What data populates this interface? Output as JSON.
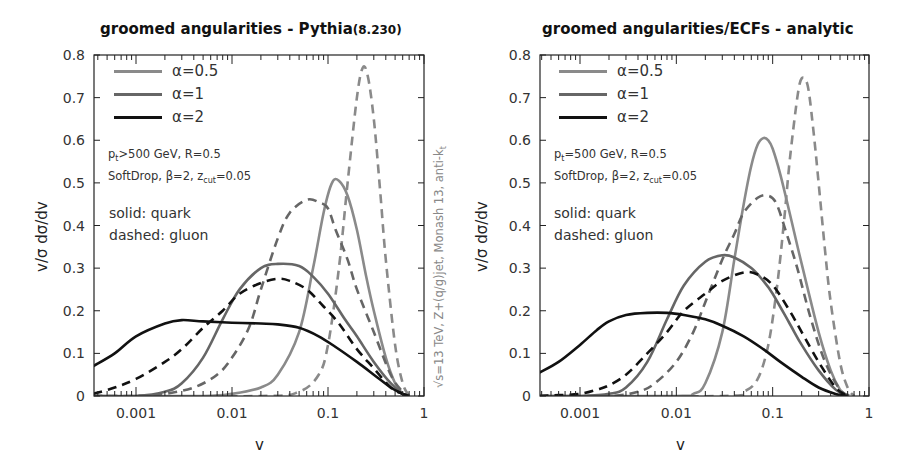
{
  "chart_data": [
    {
      "type": "line",
      "title": "groomed angularities - Pythia",
      "title_suffix": "(8.230)",
      "xlabel": "v",
      "ylabel": "v/σ dσ/dv",
      "xscale": "log",
      "xlim": [
        0.00036,
        1
      ],
      "ylim": [
        0,
        0.8
      ],
      "xticks": [
        "0.001",
        "0.01",
        "0.1",
        "1"
      ],
      "yticks": [
        "0",
        "0.1",
        "0.2",
        "0.3",
        "0.4",
        "0.5",
        "0.6",
        "0.7",
        "0.8"
      ],
      "legend": [
        "α=0.5",
        "α=1",
        "α=2"
      ],
      "annotations": [
        "p_t>500 GeV, R=0.5",
        "SoftDrop, β=2, z_cut=0.05",
        "solid: quark",
        "dashed: gluon"
      ],
      "side_note": "√s=13 TeV, Z+(q/g)jet, Monash 13, anti-k_t",
      "series": [
        {
          "name": "α=0.5 quark",
          "style": "solid",
          "color": "#8a8a8a",
          "x": [
            0.00036,
            0.005,
            0.01,
            0.02,
            0.03,
            0.05,
            0.07,
            0.09,
            0.11,
            0.13,
            0.16,
            0.2,
            0.25,
            0.3,
            0.4,
            0.5,
            0.6,
            0.7
          ],
          "y": [
            0,
            0,
            0.005,
            0.02,
            0.05,
            0.15,
            0.3,
            0.43,
            0.5,
            0.505,
            0.47,
            0.39,
            0.28,
            0.2,
            0.09,
            0.03,
            0.005,
            0
          ]
        },
        {
          "name": "α=0.5 gluon",
          "style": "dashed",
          "color": "#8a8a8a",
          "x": [
            0.00036,
            0.02,
            0.05,
            0.08,
            0.1,
            0.13,
            0.16,
            0.2,
            0.23,
            0.26,
            0.3,
            0.35,
            0.4,
            0.5,
            0.6,
            0.7
          ],
          "y": [
            0,
            0,
            0.01,
            0.05,
            0.12,
            0.3,
            0.5,
            0.7,
            0.77,
            0.75,
            0.65,
            0.48,
            0.32,
            0.12,
            0.03,
            0
          ]
        },
        {
          "name": "α=1 quark",
          "style": "solid",
          "color": "#666666",
          "x": [
            0.00036,
            0.001,
            0.002,
            0.003,
            0.005,
            0.008,
            0.012,
            0.02,
            0.03,
            0.05,
            0.07,
            0.1,
            0.15,
            0.2,
            0.3,
            0.45,
            0.6,
            0.7
          ],
          "y": [
            0,
            0,
            0.01,
            0.03,
            0.09,
            0.18,
            0.25,
            0.3,
            0.31,
            0.305,
            0.28,
            0.24,
            0.18,
            0.14,
            0.08,
            0.03,
            0.005,
            0
          ]
        },
        {
          "name": "α=1 gluon",
          "style": "dashed",
          "color": "#666666",
          "x": [
            0.00036,
            0.001,
            0.002,
            0.004,
            0.007,
            0.01,
            0.015,
            0.02,
            0.03,
            0.04,
            0.06,
            0.08,
            0.1,
            0.12,
            0.16,
            0.2,
            0.3,
            0.45,
            0.6,
            0.7
          ],
          "y": [
            0,
            0,
            0.005,
            0.02,
            0.05,
            0.09,
            0.16,
            0.25,
            0.37,
            0.43,
            0.46,
            0.455,
            0.44,
            0.39,
            0.32,
            0.25,
            0.15,
            0.05,
            0.01,
            0
          ]
        },
        {
          "name": "α=2 quark",
          "style": "solid",
          "color": "#111111",
          "x": [
            0.00036,
            0.0006,
            0.001,
            0.002,
            0.003,
            0.005,
            0.01,
            0.02,
            0.03,
            0.05,
            0.08,
            0.12,
            0.2,
            0.3,
            0.45,
            0.6,
            0.7
          ],
          "y": [
            0.07,
            0.1,
            0.14,
            0.17,
            0.178,
            0.175,
            0.172,
            0.17,
            0.168,
            0.16,
            0.14,
            0.115,
            0.08,
            0.05,
            0.02,
            0.005,
            0
          ]
        },
        {
          "name": "α=2 gluon",
          "style": "dashed",
          "color": "#111111",
          "x": [
            0.00036,
            0.0006,
            0.001,
            0.002,
            0.003,
            0.005,
            0.008,
            0.012,
            0.02,
            0.03,
            0.04,
            0.06,
            0.09,
            0.13,
            0.2,
            0.3,
            0.45,
            0.6,
            0.7
          ],
          "y": [
            0.005,
            0.02,
            0.04,
            0.08,
            0.11,
            0.16,
            0.2,
            0.24,
            0.265,
            0.275,
            0.27,
            0.25,
            0.21,
            0.17,
            0.11,
            0.065,
            0.02,
            0.005,
            0
          ]
        }
      ]
    },
    {
      "type": "line",
      "title": "groomed angularities/ECFs - analytic",
      "xlabel": "v",
      "ylabel": "v/σ dσ/dv",
      "xscale": "log",
      "xlim": [
        0.00038,
        1
      ],
      "ylim": [
        0,
        0.8
      ],
      "xticks": [
        "0.001",
        "0.01",
        "0.1",
        "1"
      ],
      "yticks": [
        "0",
        "0.1",
        "0.2",
        "0.3",
        "0.4",
        "0.5",
        "0.6",
        "0.7",
        "0.8"
      ],
      "legend": [
        "α=0.5",
        "α=1",
        "α=2"
      ],
      "annotations": [
        "p_t=500 GeV, R=0.5",
        "SoftDrop, β=2, z_cut=0.05",
        "solid: quark",
        "dashed: gluon"
      ],
      "series": [
        {
          "name": "α=0.5 quark",
          "style": "solid",
          "color": "#8a8a8a",
          "x": [
            0.00038,
            0.01,
            0.015,
            0.02,
            0.03,
            0.04,
            0.05,
            0.06,
            0.07,
            0.08,
            0.09,
            0.1,
            0.12,
            0.15,
            0.2,
            0.3,
            0.4,
            0.5,
            0.6
          ],
          "y": [
            0,
            0,
            0.005,
            0.03,
            0.15,
            0.32,
            0.45,
            0.54,
            0.59,
            0.605,
            0.6,
            0.58,
            0.52,
            0.43,
            0.31,
            0.15,
            0.06,
            0.015,
            0
          ]
        },
        {
          "name": "α=0.5 gluon",
          "style": "dashed",
          "color": "#8a8a8a",
          "x": [
            0.00038,
            0.03,
            0.05,
            0.07,
            0.09,
            0.11,
            0.13,
            0.15,
            0.18,
            0.2,
            0.23,
            0.26,
            0.3,
            0.35,
            0.4,
            0.5,
            0.6,
            0.7
          ],
          "y": [
            0,
            0,
            0.01,
            0.04,
            0.12,
            0.25,
            0.4,
            0.55,
            0.7,
            0.745,
            0.73,
            0.64,
            0.5,
            0.34,
            0.22,
            0.08,
            0.02,
            0
          ]
        },
        {
          "name": "α=1 quark",
          "style": "solid",
          "color": "#666666",
          "x": [
            0.00038,
            0.001,
            0.002,
            0.003,
            0.005,
            0.008,
            0.012,
            0.02,
            0.03,
            0.04,
            0.06,
            0.08,
            0.1,
            0.15,
            0.2,
            0.3,
            0.45,
            0.6
          ],
          "y": [
            0,
            0,
            0.005,
            0.02,
            0.08,
            0.18,
            0.26,
            0.315,
            0.33,
            0.325,
            0.3,
            0.27,
            0.24,
            0.17,
            0.12,
            0.06,
            0.015,
            0
          ]
        },
        {
          "name": "α=1 gluon",
          "style": "dashed",
          "color": "#666666",
          "x": [
            0.00038,
            0.002,
            0.004,
            0.006,
            0.01,
            0.015,
            0.02,
            0.03,
            0.04,
            0.05,
            0.07,
            0.09,
            0.11,
            0.14,
            0.18,
            0.25,
            0.35,
            0.5,
            0.65
          ],
          "y": [
            0,
            0,
            0.01,
            0.03,
            0.08,
            0.15,
            0.22,
            0.32,
            0.38,
            0.43,
            0.465,
            0.47,
            0.45,
            0.38,
            0.3,
            0.18,
            0.08,
            0.015,
            0
          ]
        },
        {
          "name": "α=2 quark",
          "style": "solid",
          "color": "#111111",
          "x": [
            0.00038,
            0.0006,
            0.001,
            0.0015,
            0.002,
            0.003,
            0.005,
            0.008,
            0.012,
            0.02,
            0.03,
            0.05,
            0.08,
            0.12,
            0.2,
            0.3,
            0.45,
            0.6
          ],
          "y": [
            0.055,
            0.08,
            0.12,
            0.155,
            0.175,
            0.19,
            0.195,
            0.195,
            0.19,
            0.18,
            0.165,
            0.14,
            0.11,
            0.08,
            0.045,
            0.02,
            0.005,
            0
          ]
        },
        {
          "name": "α=2 gluon",
          "style": "dashed",
          "color": "#111111",
          "x": [
            0.00038,
            0.0006,
            0.001,
            0.0015,
            0.002,
            0.003,
            0.005,
            0.008,
            0.012,
            0.02,
            0.03,
            0.05,
            0.07,
            0.1,
            0.15,
            0.2,
            0.3,
            0.45,
            0.6
          ],
          "y": [
            0,
            0.002,
            0.005,
            0.015,
            0.025,
            0.05,
            0.1,
            0.15,
            0.2,
            0.24,
            0.27,
            0.29,
            0.285,
            0.26,
            0.2,
            0.15,
            0.08,
            0.02,
            0
          ]
        }
      ]
    }
  ],
  "panels": [
    {
      "title": "groomed angularities - Pythia",
      "title_suffix": "(8.230)",
      "xlabel": "v",
      "ylabel": "v/σ dσ/dv",
      "legend": [
        {
          "label": "α=0.5",
          "color": "#8a8a8a"
        },
        {
          "label": "α=1",
          "color": "#666666"
        },
        {
          "label": "α=2",
          "color": "#111111"
        }
      ],
      "annot_pt_main": "p",
      "annot_pt_sub": "t",
      "annot_pt_rest": ">500 GeV, R=0.5",
      "annot_sd_main": "SoftDrop, β=2, z",
      "annot_sd_sub": "cut",
      "annot_sd_rest": "=0.05",
      "annot_solid": "solid: quark",
      "annot_dashed": "dashed: gluon",
      "side_note_main": "√s=13 TeV, Z+(q/g)jet, Monash 13, anti-k",
      "side_note_sub": "t"
    },
    {
      "title": "groomed angularities/ECFs - analytic",
      "xlabel": "v",
      "ylabel": "v/σ dσ/dv",
      "legend": [
        {
          "label": "α=0.5",
          "color": "#8a8a8a"
        },
        {
          "label": "α=1",
          "color": "#666666"
        },
        {
          "label": "α=2",
          "color": "#111111"
        }
      ],
      "annot_pt_main": "p",
      "annot_pt_sub": "t",
      "annot_pt_rest": "=500 GeV, R=0.5",
      "annot_sd_main": "SoftDrop, β=2, z",
      "annot_sd_sub": "cut",
      "annot_sd_rest": "=0.05",
      "annot_solid": "solid: quark",
      "annot_dashed": "dashed: gluon"
    }
  ]
}
